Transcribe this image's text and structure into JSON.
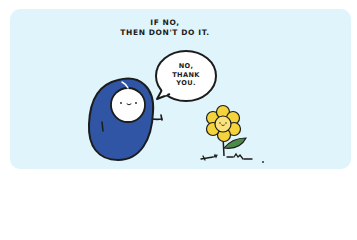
{
  "comic": {
    "caption": {
      "line1": "IF NO,",
      "line2": "THEN DON'T DO IT."
    },
    "speech_bubble": {
      "line1": "NO,",
      "line2": "THANK",
      "line3": "YOU."
    },
    "characters": [
      {
        "name": "blue-blob-character",
        "color": "#2f55a4"
      },
      {
        "name": "smiling-flower",
        "color": "#f5d33a"
      }
    ],
    "colors": {
      "background": "#dff4fb",
      "outline": "#1c1c1c",
      "character_blue": "#2f55a4",
      "flower_yellow": "#f5d33a",
      "flower_center": "#fbe27a",
      "leaf_green": "#4c8a4a"
    }
  }
}
